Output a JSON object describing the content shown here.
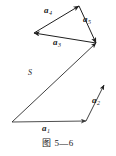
{
  "figure": {
    "caption_label": "图",
    "caption_number": "5—6",
    "caption_full": "图 5—6",
    "stroke_color": "#1f1f1f",
    "background_color": "#ffffff"
  },
  "labels": {
    "a1": {
      "base": "a",
      "sub": "1"
    },
    "a2": {
      "base": "a",
      "sub": "2"
    },
    "a3": {
      "base": "a",
      "sub": "3"
    },
    "a4": {
      "base": "a",
      "sub": "4"
    },
    "a5": {
      "base": "a",
      "sub": "5"
    },
    "s": {
      "base": "S"
    }
  },
  "chart_data": {
    "type": "diagram",
    "title": "图 5—6",
    "xlim": [
      0,
      116
    ],
    "ylim": [
      0,
      156
    ],
    "grid": false,
    "legend": null,
    "vectors": [
      {
        "name": "a1",
        "label": "a",
        "sub": "1",
        "x1": 12,
        "y1": 122,
        "x2": 86,
        "y2": 121,
        "label_x": 42,
        "label_y": 123
      },
      {
        "name": "a2",
        "label": "a",
        "sub": "2",
        "x1": 86,
        "y1": 121,
        "x2": 104,
        "y2": 85,
        "label_x": 92,
        "label_y": 99
      },
      {
        "name": "a3",
        "label": "a",
        "sub": "3",
        "x1": 96,
        "y1": 43,
        "x2": 34,
        "y2": 33,
        "label_x": 56,
        "label_y": 40
      },
      {
        "name": "a4",
        "label": "a",
        "sub": "4",
        "x1": 34,
        "y1": 33,
        "x2": 79,
        "y2": 6,
        "label_x": 48,
        "label_y": 11
      },
      {
        "name": "a5",
        "label": "a",
        "sub": "5",
        "x1": 79,
        "y1": 6,
        "x2": 96,
        "y2": 43,
        "label_x": 84,
        "label_y": 17
      },
      {
        "name": "S",
        "label": "S",
        "sub": "",
        "x1": 12,
        "y1": 122,
        "x2": 96,
        "y2": 43,
        "label_x": 30,
        "label_y": 72
      }
    ]
  }
}
